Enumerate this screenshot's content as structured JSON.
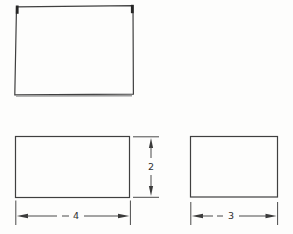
{
  "figure": {
    "colors": {
      "line": "#3f3f3f",
      "label": "#2f2f2f",
      "background": "#fdfdfc"
    },
    "dimensions": {
      "bottom_left_width": "4",
      "bottom_left_height": "2",
      "bottom_right_width": "3"
    }
  }
}
